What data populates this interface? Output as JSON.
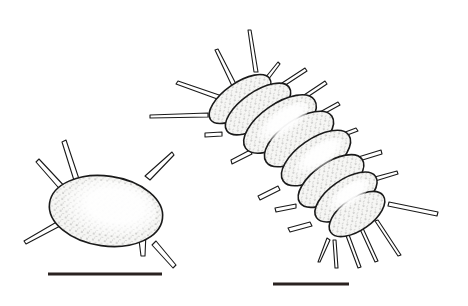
{
  "figure": {
    "panels": [
      {
        "name": "single-segment-specimen",
        "segments": 1,
        "scale_bar": true
      },
      {
        "name": "multi-segment-specimen",
        "segments": 8,
        "scale_bar": true
      }
    ],
    "colors": {
      "ink": "#1a1a1a",
      "background": "#ffffff",
      "fill": "#f4f4f2"
    }
  }
}
